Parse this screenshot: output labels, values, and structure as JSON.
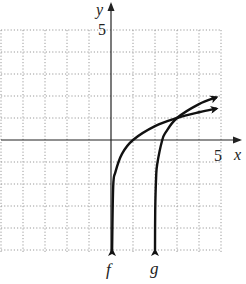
{
  "chart_data": {
    "type": "line",
    "title": "",
    "xlabel": "x",
    "ylabel": "y",
    "xlim": [
      -5,
      5
    ],
    "ylim": [
      -5,
      5
    ],
    "grid": true,
    "grid_step": 1,
    "tick_labels": {
      "x": [
        "5"
      ],
      "y": [
        "5"
      ]
    },
    "series": [
      {
        "name": "f",
        "description": "logarithmic curve, vertical asymptote x = 0, passes through (1, 0) and (3, 1)",
        "x": [
          0.05,
          0.1,
          0.2,
          0.5,
          1,
          2,
          3,
          4,
          4.8
        ],
        "y": [
          -5,
          -2.1,
          -1.46,
          -0.63,
          0,
          0.63,
          1,
          1.26,
          1.43
        ]
      },
      {
        "name": "g",
        "description": "logarithmic curve shifted right 2 and up 1, vertical asymptote x = 2, passes through (2.33, 0) and (3, 1)",
        "x": [
          2.0006,
          2.01,
          2.05,
          2.1,
          2.33,
          2.5,
          3,
          4,
          4.8
        ],
        "y": [
          -5,
          -3.19,
          -1.73,
          -1.1,
          0,
          0.37,
          1,
          1.63,
          1.94
        ]
      }
    ],
    "annotations": [
      {
        "text": "f",
        "position": "below f asymptote arrow at x = 0"
      },
      {
        "text": "g",
        "position": "below g asymptote arrow at x = 2"
      }
    ]
  },
  "labels": {
    "x_axis": "x",
    "y_axis": "y",
    "x_tick_5": "5",
    "y_tick_5": "5",
    "curve_f": "f",
    "curve_g": "g"
  }
}
